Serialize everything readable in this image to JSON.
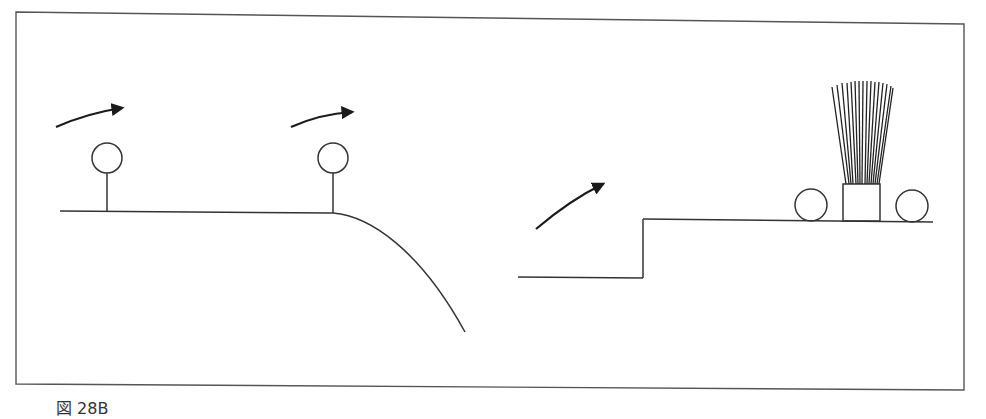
{
  "figure": {
    "caption": "図 28B",
    "frame": {
      "stroke": "#555555"
    },
    "line_color": "#333333",
    "panels": [
      {
        "name": "left-panel",
        "description": "Flat surface ending in a downward curved edge with two ball-on-stem markers and motion arrows",
        "elements": [
          "arrow",
          "ball-on-stem",
          "arrow",
          "ball-on-stem",
          "ground-line",
          "curved-drop"
        ]
      },
      {
        "name": "right-panel",
        "description": "Raised step with an arrow indicating upward motion and a brush between two rollers",
        "elements": [
          "lower-ground-line",
          "step-riser",
          "upper-ground-line",
          "arrow",
          "roller",
          "brush",
          "roller"
        ]
      }
    ]
  }
}
